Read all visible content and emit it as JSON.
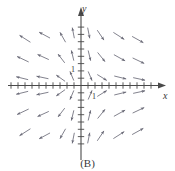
{
  "figure": {
    "caption": "(B)",
    "type": "slope-field",
    "axis_color": "#4a4a4a",
    "arrow_color": "#6b6b78"
  },
  "axes": {
    "x_label": "x",
    "y_label": "y",
    "x_unit_label": "1",
    "y_unit_label": "1",
    "x_tick_count": 20,
    "y_tick_count": 17
  },
  "chart_data": {
    "type": "scatter",
    "title": "",
    "subtitle": "",
    "xlabel": "x",
    "ylabel": "y",
    "xlim": [
      -10,
      10
    ],
    "ylim": [
      -9,
      9
    ],
    "grid": false,
    "legend": null,
    "annotations": [
      "(B)"
    ],
    "vectors": [
      {
        "x": -8.0,
        "y": 6.4,
        "dx": -1.55,
        "dy": 0.95
      },
      {
        "x": -5.2,
        "y": 6.9,
        "dx": -1.55,
        "dy": 0.8
      },
      {
        "x": -2.6,
        "y": 6.6,
        "dx": -0.8,
        "dy": 1.35
      },
      {
        "x": -1.1,
        "y": 7.2,
        "dx": -0.3,
        "dy": 1.45
      },
      {
        "x": -8.3,
        "y": 3.6,
        "dx": -1.65,
        "dy": 0.75
      },
      {
        "x": -5.4,
        "y": 3.9,
        "dx": -1.6,
        "dy": 0.7
      },
      {
        "x": -2.8,
        "y": 3.7,
        "dx": -0.95,
        "dy": 1.2
      },
      {
        "x": -1.2,
        "y": 4.1,
        "dx": -0.35,
        "dy": 1.4
      },
      {
        "x": -8.4,
        "y": 1.0,
        "dx": -1.7,
        "dy": 0.4
      },
      {
        "x": -5.5,
        "y": 1.1,
        "dx": -1.7,
        "dy": 0.35
      },
      {
        "x": -2.9,
        "y": 1.0,
        "dx": -1.25,
        "dy": 0.85
      },
      {
        "x": -1.3,
        "y": 1.3,
        "dx": -0.55,
        "dy": 1.25
      },
      {
        "x": 1.1,
        "y": 7.2,
        "dx": 0.3,
        "dy": -1.45
      },
      {
        "x": 2.8,
        "y": 6.9,
        "dx": 0.95,
        "dy": -1.35
      },
      {
        "x": 5.4,
        "y": 6.8,
        "dx": 1.55,
        "dy": -0.95
      },
      {
        "x": 8.1,
        "y": 6.3,
        "dx": 1.6,
        "dy": -0.85
      },
      {
        "x": 1.2,
        "y": 4.1,
        "dx": 0.35,
        "dy": -1.4
      },
      {
        "x": 2.9,
        "y": 3.9,
        "dx": 1.05,
        "dy": -1.25
      },
      {
        "x": 5.5,
        "y": 3.8,
        "dx": 1.6,
        "dy": -0.85
      },
      {
        "x": 8.2,
        "y": 3.4,
        "dx": 1.65,
        "dy": -0.75
      },
      {
        "x": 1.3,
        "y": 1.3,
        "dx": 0.55,
        "dy": -1.25
      },
      {
        "x": 3.0,
        "y": 1.1,
        "dx": 1.35,
        "dy": -0.8
      },
      {
        "x": 5.6,
        "y": 1.1,
        "dx": 1.7,
        "dy": -0.4
      },
      {
        "x": 8.3,
        "y": 0.9,
        "dx": 1.7,
        "dy": -0.35
      },
      {
        "x": -8.4,
        "y": -1.0,
        "dx": -1.7,
        "dy": -0.4
      },
      {
        "x": -5.5,
        "y": -1.1,
        "dx": -1.7,
        "dy": -0.35
      },
      {
        "x": -2.9,
        "y": -1.0,
        "dx": -1.25,
        "dy": -0.85
      },
      {
        "x": -1.3,
        "y": -1.3,
        "dx": -0.55,
        "dy": -1.25
      },
      {
        "x": -8.3,
        "y": -3.6,
        "dx": -1.65,
        "dy": -0.75
      },
      {
        "x": -5.4,
        "y": -3.9,
        "dx": -1.6,
        "dy": -0.7
      },
      {
        "x": -2.8,
        "y": -3.7,
        "dx": -0.95,
        "dy": -1.2
      },
      {
        "x": -1.2,
        "y": -4.1,
        "dx": -0.35,
        "dy": -1.4
      },
      {
        "x": -8.0,
        "y": -6.4,
        "dx": -1.55,
        "dy": -0.95
      },
      {
        "x": -5.2,
        "y": -6.9,
        "dx": -1.55,
        "dy": -0.8
      },
      {
        "x": -2.6,
        "y": -6.6,
        "dx": -0.8,
        "dy": -1.35
      },
      {
        "x": -1.1,
        "y": -7.2,
        "dx": -0.3,
        "dy": -1.45
      },
      {
        "x": 1.3,
        "y": -1.3,
        "dx": 0.55,
        "dy": 1.25
      },
      {
        "x": 3.0,
        "y": -1.1,
        "dx": 1.35,
        "dy": 0.8
      },
      {
        "x": 5.6,
        "y": -1.1,
        "dx": 1.7,
        "dy": 0.4
      },
      {
        "x": 8.3,
        "y": -0.9,
        "dx": 1.7,
        "dy": 0.35
      },
      {
        "x": 1.2,
        "y": -4.1,
        "dx": 0.35,
        "dy": 1.4
      },
      {
        "x": 2.9,
        "y": -3.9,
        "dx": 1.05,
        "dy": 1.25
      },
      {
        "x": 5.5,
        "y": -3.8,
        "dx": 1.6,
        "dy": 0.85
      },
      {
        "x": 8.2,
        "y": -3.4,
        "dx": 1.65,
        "dy": 0.75
      },
      {
        "x": 1.1,
        "y": -7.2,
        "dx": 0.3,
        "dy": 1.45
      },
      {
        "x": 2.8,
        "y": -6.9,
        "dx": 0.95,
        "dy": 1.35
      },
      {
        "x": 5.4,
        "y": -6.8,
        "dx": 1.55,
        "dy": 0.95
      },
      {
        "x": 8.1,
        "y": -6.3,
        "dx": 1.6,
        "dy": 0.85
      }
    ]
  }
}
